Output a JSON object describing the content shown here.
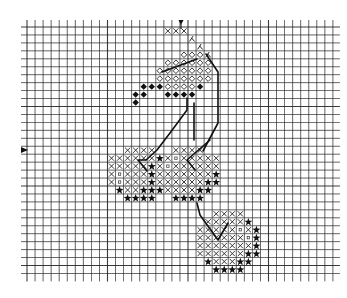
{
  "chart_data": {
    "type": "cross-stitch-pattern",
    "title": "",
    "grid": {
      "origin_x": 27,
      "origin_y": 27,
      "cell_w": 8.05,
      "cell_h": 7.95,
      "cols": 38,
      "rows": 31,
      "line_color": "#1a1a1a",
      "extend_top": 7,
      "extend_bottom": 8,
      "extend_left": 6,
      "extend_right": 7
    },
    "markers": {
      "top_center": {
        "symbol": "down-triangle",
        "x": 181,
        "y": 20
      },
      "left_center": {
        "symbol": "right-triangle",
        "x": 21,
        "y": 150
      }
    },
    "legend_symbols": {
      "X": "cross",
      "O": "open-diamond",
      "D": "filled-diamond",
      "S": "star",
      "Q": "small-square",
      "H": "half-stitch"
    },
    "rows": [
      {
        "r": 0,
        "cells": [
          [
            17,
            "X"
          ],
          [
            18,
            "X"
          ],
          [
            19,
            "X"
          ]
        ]
      },
      {
        "r": 1,
        "cells": [
          [
            20,
            "H"
          ]
        ]
      },
      {
        "r": 2,
        "cells": [
          [
            21,
            "H"
          ]
        ]
      },
      {
        "r": 3,
        "cells": [
          [
            19,
            "O"
          ],
          [
            20,
            "O"
          ],
          [
            21,
            "O"
          ],
          [
            22,
            "H"
          ]
        ]
      },
      {
        "r": 4,
        "cells": [
          [
            17,
            "O"
          ],
          [
            18,
            "O"
          ],
          [
            19,
            "O"
          ],
          [
            20,
            "O"
          ],
          [
            21,
            "O"
          ],
          [
            22,
            "O"
          ]
        ]
      },
      {
        "r": 5,
        "cells": [
          [
            16,
            "O"
          ],
          [
            17,
            "O"
          ],
          [
            18,
            "O"
          ],
          [
            19,
            "O"
          ],
          [
            20,
            "O"
          ],
          [
            21,
            "O"
          ],
          [
            22,
            "O"
          ]
        ]
      },
      {
        "r": 6,
        "cells": [
          [
            16,
            "O"
          ],
          [
            17,
            "O"
          ],
          [
            18,
            "O"
          ],
          [
            19,
            "O"
          ],
          [
            20,
            "O"
          ],
          [
            21,
            "O"
          ],
          [
            22,
            "O"
          ]
        ]
      },
      {
        "r": 7,
        "cells": [
          [
            14,
            "D"
          ],
          [
            15,
            "D"
          ],
          [
            16,
            "D"
          ],
          [
            17,
            "O"
          ],
          [
            18,
            "O"
          ],
          [
            19,
            "O"
          ],
          [
            20,
            "O"
          ],
          [
            21,
            "D"
          ]
        ]
      },
      {
        "r": 8,
        "cells": [
          [
            13,
            "D"
          ],
          [
            14,
            "D"
          ],
          [
            17,
            "D"
          ],
          [
            18,
            "D"
          ],
          [
            19,
            "D"
          ],
          [
            20,
            "D"
          ]
        ]
      },
      {
        "r": 9,
        "cells": [
          [
            13,
            "D"
          ]
        ]
      },
      {
        "r": 15,
        "cells": [
          [
            12,
            "X"
          ],
          [
            13,
            "X"
          ],
          [
            14,
            "X"
          ],
          [
            15,
            "X"
          ],
          [
            18,
            "X"
          ],
          [
            19,
            "X"
          ],
          [
            20,
            "X"
          ],
          [
            21,
            "X"
          ]
        ]
      },
      {
        "r": 16,
        "cells": [
          [
            10,
            "X"
          ],
          [
            11,
            "X"
          ],
          [
            12,
            "X"
          ],
          [
            13,
            "X"
          ],
          [
            14,
            "X"
          ],
          [
            15,
            "X"
          ],
          [
            16,
            "S"
          ],
          [
            17,
            "X"
          ],
          [
            18,
            "Q"
          ],
          [
            19,
            "X"
          ],
          [
            20,
            "X"
          ],
          [
            21,
            "X"
          ],
          [
            22,
            "X"
          ],
          [
            23,
            "X"
          ]
        ]
      },
      {
        "r": 17,
        "cells": [
          [
            10,
            "X"
          ],
          [
            11,
            "X"
          ],
          [
            12,
            "X"
          ],
          [
            13,
            "X"
          ],
          [
            14,
            "X"
          ],
          [
            15,
            "S"
          ],
          [
            16,
            "X"
          ],
          [
            17,
            "Q"
          ],
          [
            18,
            "X"
          ],
          [
            19,
            "X"
          ],
          [
            20,
            "X"
          ],
          [
            21,
            "X"
          ],
          [
            22,
            "X"
          ],
          [
            23,
            "X"
          ]
        ]
      },
      {
        "r": 18,
        "cells": [
          [
            10,
            "X"
          ],
          [
            11,
            "Q"
          ],
          [
            12,
            "X"
          ],
          [
            13,
            "X"
          ],
          [
            14,
            "X"
          ],
          [
            15,
            "S"
          ],
          [
            16,
            "X"
          ],
          [
            17,
            "X"
          ],
          [
            18,
            "X"
          ],
          [
            19,
            "X"
          ],
          [
            20,
            "X"
          ],
          [
            21,
            "X"
          ],
          [
            22,
            "X"
          ],
          [
            23,
            "S"
          ]
        ]
      },
      {
        "r": 19,
        "cells": [
          [
            10,
            "X"
          ],
          [
            11,
            "Q"
          ],
          [
            12,
            "X"
          ],
          [
            13,
            "X"
          ],
          [
            14,
            "X"
          ],
          [
            15,
            "S"
          ],
          [
            16,
            "X"
          ],
          [
            17,
            "X"
          ],
          [
            18,
            "X"
          ],
          [
            19,
            "X"
          ],
          [
            20,
            "X"
          ],
          [
            21,
            "X"
          ],
          [
            22,
            "S"
          ],
          [
            23,
            "S"
          ]
        ]
      },
      {
        "r": 20,
        "cells": [
          [
            11,
            "S"
          ],
          [
            12,
            "X"
          ],
          [
            13,
            "X"
          ],
          [
            14,
            "S"
          ],
          [
            15,
            "S"
          ],
          [
            16,
            "S"
          ],
          [
            17,
            "X"
          ],
          [
            18,
            "X"
          ],
          [
            19,
            "X"
          ],
          [
            20,
            "X"
          ],
          [
            21,
            "S"
          ],
          [
            22,
            "S"
          ]
        ]
      },
      {
        "r": 21,
        "cells": [
          [
            12,
            "S"
          ],
          [
            13,
            "S"
          ],
          [
            14,
            "S"
          ],
          [
            15,
            "S"
          ],
          [
            18,
            "S"
          ],
          [
            19,
            "S"
          ],
          [
            20,
            "S"
          ],
          [
            21,
            "S"
          ]
        ]
      },
      {
        "r": 23,
        "cells": [
          [
            23,
            "X"
          ],
          [
            24,
            "X"
          ],
          [
            25,
            "X"
          ],
          [
            26,
            "X"
          ]
        ]
      },
      {
        "r": 24,
        "cells": [
          [
            22,
            "X"
          ],
          [
            23,
            "X"
          ],
          [
            24,
            "X"
          ],
          [
            25,
            "X"
          ],
          [
            26,
            "X"
          ],
          [
            27,
            "S"
          ]
        ]
      },
      {
        "r": 25,
        "cells": [
          [
            21,
            "X"
          ],
          [
            22,
            "X"
          ],
          [
            23,
            "X"
          ],
          [
            24,
            "X"
          ],
          [
            25,
            "X"
          ],
          [
            26,
            "Q"
          ],
          [
            27,
            "X"
          ],
          [
            28,
            "S"
          ]
        ]
      },
      {
        "r": 26,
        "cells": [
          [
            21,
            "X"
          ],
          [
            22,
            "X"
          ],
          [
            23,
            "X"
          ],
          [
            24,
            "X"
          ],
          [
            25,
            "X"
          ],
          [
            26,
            "X"
          ],
          [
            27,
            "Q"
          ],
          [
            28,
            "S"
          ]
        ]
      },
      {
        "r": 27,
        "cells": [
          [
            21,
            "X"
          ],
          [
            22,
            "X"
          ],
          [
            23,
            "X"
          ],
          [
            24,
            "X"
          ],
          [
            25,
            "X"
          ],
          [
            26,
            "X"
          ],
          [
            27,
            "X"
          ],
          [
            28,
            "S"
          ]
        ]
      },
      {
        "r": 28,
        "cells": [
          [
            21,
            "X"
          ],
          [
            22,
            "X"
          ],
          [
            23,
            "X"
          ],
          [
            24,
            "X"
          ],
          [
            25,
            "X"
          ],
          [
            26,
            "X"
          ],
          [
            27,
            "S"
          ],
          [
            28,
            "S"
          ]
        ]
      },
      {
        "r": 29,
        "cells": [
          [
            22,
            "S"
          ],
          [
            23,
            "X"
          ],
          [
            24,
            "X"
          ],
          [
            25,
            "X"
          ],
          [
            26,
            "S"
          ],
          [
            27,
            "S"
          ]
        ]
      },
      {
        "r": 30,
        "cells": [
          [
            23,
            "S"
          ],
          [
            24,
            "S"
          ],
          [
            25,
            "S"
          ],
          [
            26,
            "S"
          ]
        ]
      }
    ],
    "stem_paths": [
      "M 162 72 L 197 59",
      "M 206 54 L 218 72 L 218 123 L 203 151",
      "M 187 98 L 187 110 L 170 133 L 157 150 L 146 160 L 138 160 L 147 171",
      "M 194 103 L 194 140",
      "M 210 140 L 187 160 L 195 170",
      "M 197 203 L 200 215 L 218 240 L 228 223"
    ],
    "stem_width": 1.6
  }
}
